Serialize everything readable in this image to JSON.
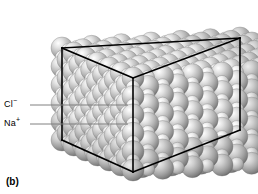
{
  "figure": {
    "caption": "(b)",
    "background_color": "#ffffff",
    "width": 258,
    "height": 194
  },
  "labels": [
    {
      "id": "chloride",
      "text": "Cl",
      "charge": "−",
      "name": "Cl⁻",
      "leader_line": {
        "x1": 30,
        "y1": 105,
        "x2": 128,
        "y2": 105
      }
    },
    {
      "id": "sodium",
      "text": "Na",
      "charge": "+",
      "name": "Na⁺",
      "leader_line": {
        "x1": 30,
        "y1": 124,
        "x2": 128,
        "y2": 124
      }
    }
  ],
  "leader_line_color": "#808080",
  "unit_cell": {
    "stroke": "#000000",
    "stroke_width": 1.6,
    "vertices": {
      "back_top_left": [
        62,
        48
      ],
      "back_top_right": [
        240,
        38
      ],
      "front_top": [
        133,
        78
      ],
      "front_top_right_hidden": [
        240,
        38
      ],
      "front_bottom": [
        133,
        172
      ],
      "bottom_left": [
        62,
        140
      ],
      "bottom_right": [
        240,
        130
      ]
    }
  },
  "chart_data": {
    "type": "scatter",
    "xlabel": "",
    "ylabel": "",
    "legend": [
      "Cl⁻",
      "Na⁺"
    ],
    "ion_species": [
      {
        "name": "Cl⁻",
        "role": "anion",
        "relative_radius": 1.0,
        "render_radius_px": 11,
        "color_light": "#f0f0f0",
        "color_mid": "#b8b8b8",
        "color_dark": "#6e6e6e"
      },
      {
        "name": "Na⁺",
        "role": "cation",
        "relative_radius": 0.62,
        "render_radius_px": 6.8,
        "color_light": "#fbfbfb",
        "color_mid": "#cfcfcf",
        "color_dark": "#8a8a8a"
      }
    ],
    "lattice": {
      "type": "face-centered-cubic-rocksalt",
      "nx": 6,
      "ny": 5,
      "nz": 6
    }
  }
}
